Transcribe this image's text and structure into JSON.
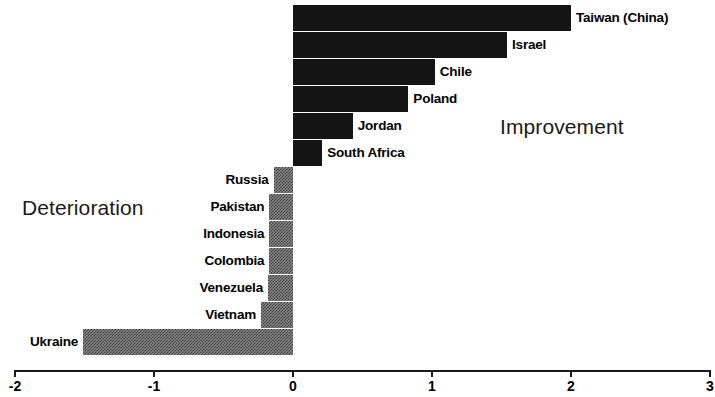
{
  "chart_data": {
    "type": "bar",
    "orientation": "horizontal",
    "title": "",
    "xlabel": "",
    "ylabel": "",
    "xlim": [
      -2,
      3
    ],
    "xticks": [
      "-2",
      "-1",
      "0",
      "1",
      "2",
      "3"
    ],
    "xtick_values": [
      -2,
      -1,
      0,
      1,
      2,
      3
    ],
    "grid": false,
    "legend": "none",
    "zero_line": 0,
    "categories": [
      "Taiwan (China)",
      "Israel",
      "Chile",
      "Poland",
      "Jordan",
      "South Africa",
      "Russia",
      "Pakistan",
      "Indonesia",
      "Colombia",
      "Venezuela",
      "Vietnam",
      "Ukraine"
    ],
    "values": [
      2.0,
      1.54,
      1.02,
      0.83,
      0.43,
      0.21,
      -0.14,
      -0.17,
      -0.17,
      -0.17,
      -0.18,
      -0.23,
      -1.51
    ],
    "annotations": [
      {
        "text": "Improvement",
        "x": 1.5,
        "y": 4.5
      },
      {
        "text": "Deterioration",
        "x": -1.45,
        "y": 7.7
      }
    ],
    "colors": {
      "positive_bar": "#141414",
      "negative_bar": "#8a8a8a",
      "axis": "#1a1a1a",
      "text": "#000000",
      "background": "#ffffff"
    }
  },
  "bars": [
    {
      "label": "Taiwan (China)",
      "value": 2.0,
      "sign": "pos"
    },
    {
      "label": "Israel",
      "value": 1.54,
      "sign": "pos"
    },
    {
      "label": "Chile",
      "value": 1.02,
      "sign": "pos"
    },
    {
      "label": "Poland",
      "value": 0.83,
      "sign": "pos"
    },
    {
      "label": "Jordan",
      "value": 0.43,
      "sign": "pos"
    },
    {
      "label": "South Africa",
      "value": 0.21,
      "sign": "pos"
    },
    {
      "label": "Russia",
      "value": -0.14,
      "sign": "neg"
    },
    {
      "label": "Pakistan",
      "value": -0.17,
      "sign": "neg"
    },
    {
      "label": "Indonesia",
      "value": -0.17,
      "sign": "neg"
    },
    {
      "label": "Colombia",
      "value": -0.17,
      "sign": "neg"
    },
    {
      "label": "Venezuela",
      "value": -0.18,
      "sign": "neg"
    },
    {
      "label": "Vietnam",
      "value": -0.23,
      "sign": "neg"
    },
    {
      "label": "Ukraine",
      "value": -1.51,
      "sign": "neg"
    }
  ],
  "annotations": {
    "improvement": "Improvement",
    "deterioration": "Deterioration"
  },
  "axis": {
    "ticks": [
      "-2",
      "-1",
      "0",
      "1",
      "2",
      "3"
    ]
  }
}
